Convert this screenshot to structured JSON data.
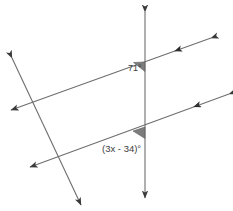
{
  "figure": {
    "name": "parallel-lines-transversal-angle-diagram",
    "width": 233,
    "height": 211,
    "background_color": "#ffffff",
    "line_color": "#6e6e6e",
    "arrow_color": "#3a3a3a",
    "angle_marker_color": "#7d7d7d",
    "label_color": "#3b3b3b"
  },
  "labels": {
    "upper_angle": "71°",
    "lower_angle": "(3x - 34)°"
  },
  "lines": [
    {
      "id": "vertical-transversal",
      "role": "transversal",
      "x1": 145,
      "y1": 12,
      "x2": 145,
      "y2": 198,
      "arrowheads": [
        "start",
        "end"
      ]
    },
    {
      "id": "diagonal-transversal",
      "role": "transversal",
      "x1": 12,
      "y1": 58,
      "x2": 81,
      "y2": 205,
      "arrowheads": [
        "start",
        "end"
      ]
    },
    {
      "id": "upper-parallel-line",
      "role": "parallel",
      "x1": 11,
      "y1": 110,
      "x2": 211,
      "y2": 38,
      "arrowheads": [
        "start",
        "end"
      ],
      "tick_arrows": 1
    },
    {
      "id": "lower-parallel-line",
      "role": "parallel",
      "x1": 30,
      "y1": 167,
      "x2": 229,
      "y2": 94,
      "arrowheads": [
        "start",
        "end"
      ],
      "tick_arrows": 1
    }
  ],
  "intersections": [
    {
      "id": "upper-intersection",
      "x": 145,
      "y": 62,
      "angle_marker": "shaded-wedge",
      "label_ref": "upper_angle"
    },
    {
      "id": "lower-intersection",
      "x": 145,
      "y": 128,
      "angle_marker": "shaded-wedge",
      "label_ref": "lower_angle"
    }
  ]
}
